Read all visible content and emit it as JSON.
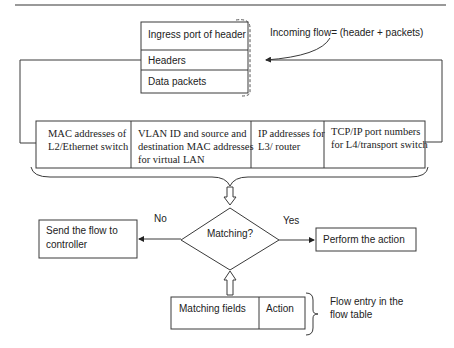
{
  "packet": {
    "rows": [
      "Ingress port of header",
      "Headers",
      "Data packets"
    ]
  },
  "incoming_label": "Incoming flow= (header + packets)",
  "match_fields": [
    [
      "MAC addresses of",
      "L2/Ethernet switch"
    ],
    [
      "VLAN ID and source and",
      "destination MAC addresses",
      "for virtual LAN"
    ],
    [
      "IP addresses for",
      "L3/ router"
    ],
    [
      "TCP/IP port numbers",
      "for L4/transport switch"
    ]
  ],
  "decision": {
    "label": "Matching?",
    "no_label": "No",
    "yes_label": "Yes"
  },
  "no_action": [
    "Send the flow to",
    "controller"
  ],
  "yes_action": "Perform the action",
  "flow_entry": {
    "fields": [
      "Matching fields",
      "Action"
    ],
    "caption": [
      "Flow entry in the",
      "flow table"
    ]
  },
  "colors": {
    "line": "#3a3a3a",
    "text": "#222222",
    "background": "#ffffff"
  }
}
